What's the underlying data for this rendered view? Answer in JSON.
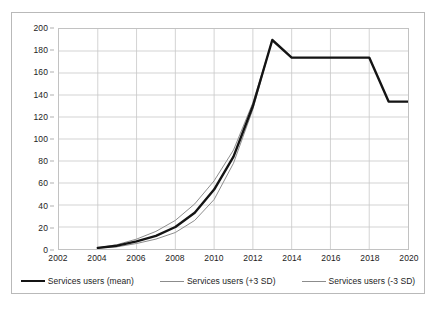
{
  "chart_data": {
    "type": "line",
    "title": "",
    "xlabel": "",
    "ylabel": "",
    "xlim": [
      2002,
      2020
    ],
    "ylim": [
      0,
      200
    ],
    "ytick_step": 20,
    "xtick_step": 2,
    "grid": true,
    "legend_position": "bottom",
    "ytick_labels": [
      "0",
      "20",
      "40",
      "60",
      "80",
      "100",
      "120",
      "140",
      "160",
      "180",
      "200"
    ],
    "xtick_labels": [
      "2002",
      "2004",
      "2006",
      "2008",
      "2010",
      "2012",
      "2014",
      "2016",
      "2018",
      "2020"
    ],
    "x": [
      2004,
      2005,
      2006,
      2007,
      2008,
      2009,
      2010,
      2011,
      2012,
      2013,
      2014,
      2015,
      2016,
      2017,
      2018,
      2019,
      2020
    ],
    "series": [
      {
        "name": "Services users (mean)",
        "color": "#141414",
        "width": 2.4,
        "values": [
          1,
          3,
          7,
          12,
          20,
          33,
          54,
          84,
          130,
          190,
          174,
          174,
          174,
          174,
          174,
          134,
          134
        ]
      },
      {
        "name": "Services users (+3 SD)",
        "color": "#8c8c8c",
        "width": 1.0,
        "values": [
          1,
          4,
          9,
          16,
          26,
          41,
          62,
          90,
          133,
          190,
          174,
          174,
          174,
          174,
          174,
          134,
          134
        ]
      },
      {
        "name": "Services users (-3 SD)",
        "color": "#8c8c8c",
        "width": 1.0,
        "values": [
          1,
          2,
          5,
          9,
          15,
          26,
          45,
          78,
          127,
          190,
          174,
          174,
          174,
          174,
          174,
          134,
          134
        ]
      }
    ],
    "annotations": {
      "peak_year": 2013,
      "peak_value": 190,
      "plateau_value": 174,
      "final_value": 134
    }
  },
  "legend": {
    "items": [
      {
        "label": "Services users (mean)",
        "style": "mean"
      },
      {
        "label": "Services users (+3 SD)",
        "style": "sd"
      },
      {
        "label": "Services users (-3 SD)",
        "style": "sd"
      }
    ]
  },
  "colors": {
    "mean_line": "#141414",
    "sd_line": "#8c8c8c",
    "grid": "#c7c7c7",
    "plot_border": "#c2c2c2",
    "frame_border": "#b9b9b9",
    "background": "#ffffff",
    "text": "#1c1c1c"
  }
}
